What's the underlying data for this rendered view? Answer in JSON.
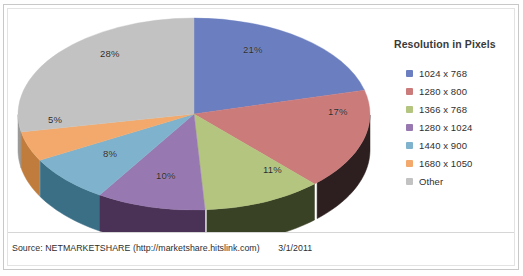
{
  "chart_data": {
    "type": "pie",
    "title": "",
    "legend_title": "Resolution in Pixels",
    "legend_position": "right",
    "three_d": true,
    "categories": [
      "1024 x 768",
      "1280 x 800",
      "1366 x 768",
      "1280 x 1024",
      "1440 x 900",
      "1680 x 1050",
      "Other"
    ],
    "values": [
      21,
      17,
      11,
      10,
      8,
      5,
      28
    ],
    "value_labels": [
      "21%",
      "17%",
      "11%",
      "10%",
      "8%",
      "5%",
      "28%"
    ],
    "unit": "%",
    "colors": [
      "#6b7fc0",
      "#cc7b7b",
      "#b3c57f",
      "#9878b0",
      "#7fb2cc",
      "#f2a96b",
      "#c2c2c2"
    ],
    "side_colors": [
      "#4c5c92",
      "#2d1f1f",
      "#3a4226",
      "#4a3257",
      "#3a6f86",
      "#c07c3d",
      "#9a9a9a"
    ],
    "slices": [
      {
        "label": "1024 x 768",
        "value": 21,
        "display": "21%",
        "color": "#6b7fc0"
      },
      {
        "label": "1280 x 800",
        "value": 17,
        "display": "17%",
        "color": "#cc7b7b"
      },
      {
        "label": "1366 x 768",
        "value": 11,
        "display": "11%",
        "color": "#b3c57f"
      },
      {
        "label": "1280 x 1024",
        "value": 10,
        "display": "10%",
        "color": "#9878b0"
      },
      {
        "label": "1440 x 900",
        "value": 8,
        "display": "8%",
        "color": "#7fb2cc"
      },
      {
        "label": "1680 x 1050",
        "value": 5,
        "display": "5%",
        "color": "#f2a96b"
      },
      {
        "label": "Other",
        "value": 28,
        "display": "28%",
        "color": "#c2c2c2"
      }
    ]
  },
  "legend": {
    "title": "Resolution in Pixels",
    "items": [
      {
        "label": "1024 x 768",
        "color": "#6b7fc0"
      },
      {
        "label": "1280 x 800",
        "color": "#cc7b7b"
      },
      {
        "label": "1366 x 768",
        "color": "#b3c57f"
      },
      {
        "label": "1280 x 1024",
        "color": "#9878b0"
      },
      {
        "label": "1440 x 900",
        "color": "#7fb2cc"
      },
      {
        "label": "1680 x 1050",
        "color": "#f2a96b"
      },
      {
        "label": "Other",
        "color": "#c2c2c2"
      }
    ]
  },
  "caption": {
    "source": "Source: NETMARKETSHARE (http://marketshare.hitslink.com)",
    "date": "3/1/2011"
  }
}
